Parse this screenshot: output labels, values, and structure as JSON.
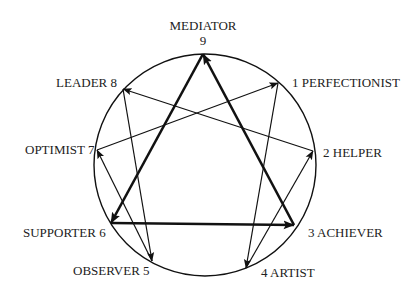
{
  "diagram": {
    "colors": {
      "line": "#111111",
      "text": "#222222",
      "background": "#ffffff"
    },
    "circle": {
      "cx": 205,
      "cy": 165,
      "r": 111
    },
    "points": [
      {
        "id": 9,
        "name": "MEDIATOR",
        "x": 203,
        "y": 54
      },
      {
        "id": 1,
        "name": "PERFECTIONIST",
        "x": 278,
        "y": 83
      },
      {
        "id": 2,
        "name": "HELPER",
        "x": 313,
        "y": 151
      },
      {
        "id": 3,
        "name": "ACHIEVER",
        "x": 294,
        "y": 225
      },
      {
        "id": 4,
        "name": "ARTIST",
        "x": 246,
        "y": 268
      },
      {
        "id": 5,
        "name": "OBSERVER",
        "x": 152,
        "y": 261
      },
      {
        "id": 6,
        "name": "SUPPORTER",
        "x": 111,
        "y": 223
      },
      {
        "id": 7,
        "name": "OPTIMIST",
        "x": 97,
        "y": 150
      },
      {
        "id": 8,
        "name": "LEADER",
        "x": 123,
        "y": 89
      }
    ],
    "arrows": [
      {
        "from": 3,
        "to": 9,
        "weight": "thick"
      },
      {
        "from": 9,
        "to": 6,
        "weight": "thick"
      },
      {
        "from": 6,
        "to": 3,
        "weight": "thick"
      },
      {
        "from": 7,
        "to": 1,
        "weight": "thin"
      },
      {
        "from": 1,
        "to": 4,
        "weight": "thin"
      },
      {
        "from": 4,
        "to": 2,
        "weight": "thin"
      },
      {
        "from": 2,
        "to": 8,
        "weight": "thin"
      },
      {
        "from": 8,
        "to": 5,
        "weight": "thin"
      },
      {
        "from": 5,
        "to": 7,
        "weight": "thin"
      }
    ],
    "labels": {
      "p9_name": "MEDIATOR",
      "p9_num": "9",
      "p1": "1  PERFECTIONIST",
      "p2": "2  HELPER",
      "p3": "3  ACHIEVER",
      "p4": "4  ARTIST",
      "p5": "OBSERVER  5",
      "p6": "SUPPORTER  6",
      "p7": "OPTIMIST  7",
      "p8": "LEADER  8"
    }
  }
}
